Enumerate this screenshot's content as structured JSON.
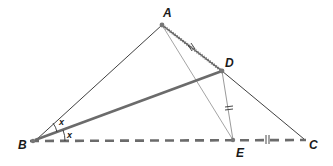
{
  "diagram": {
    "type": "geometry-triangle",
    "points": {
      "A": {
        "label": "A",
        "x": 162,
        "y": 25
      },
      "B": {
        "label": "B",
        "x": 33,
        "y": 141
      },
      "C": {
        "label": "C",
        "x": 305,
        "y": 140
      },
      "D": {
        "label": "D",
        "x": 222,
        "y": 71
      },
      "E": {
        "label": "E",
        "x": 233,
        "y": 140
      }
    },
    "segments": [
      {
        "name": "AB",
        "style": "thin"
      },
      {
        "name": "AD",
        "style": "hatched",
        "marks": "double-tick"
      },
      {
        "name": "DC",
        "style": "thin"
      },
      {
        "name": "BD",
        "style": "thick"
      },
      {
        "name": "AE",
        "style": "thin-light"
      },
      {
        "name": "DE",
        "style": "thin-light",
        "marks": "double-tick"
      },
      {
        "name": "BC",
        "style": "dashed",
        "marks_on": "EC double-tick"
      }
    ],
    "angles": [
      {
        "vertex": "B",
        "between": [
          "BA",
          "BD"
        ],
        "label": "x"
      },
      {
        "vertex": "B",
        "between": [
          "BD",
          "BC"
        ],
        "label": "x"
      }
    ],
    "colors": {
      "line": "#2a2a2a",
      "thick": "#6b6b6b",
      "light": "#9a9a9a",
      "dashed": "#6b6b6b",
      "point": "#777777"
    }
  }
}
